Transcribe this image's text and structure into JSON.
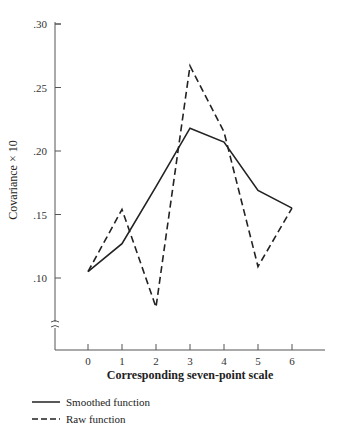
{
  "chart_data": {
    "type": "line",
    "title": "",
    "xlabel": "Corresponding seven-point scale",
    "ylabel": "Covariance × 10",
    "x": [
      0,
      1,
      2,
      3,
      4,
      5,
      6
    ],
    "categories": [
      "0",
      "1",
      "2",
      "3",
      "4",
      "5",
      "6"
    ],
    "yticks": [
      ".10",
      ".15",
      ".20",
      ".25",
      ".30"
    ],
    "ytick_values": [
      0.1,
      0.15,
      0.2,
      0.25,
      0.3
    ],
    "ylim": [
      0.06,
      0.3
    ],
    "axis_break": true,
    "grid": false,
    "legend_position": "bottom-left",
    "series": [
      {
        "name": "Smoothed function",
        "style": "solid",
        "values": [
          0.105,
          0.127,
          0.172,
          0.218,
          0.207,
          0.169,
          0.155
        ]
      },
      {
        "name": "Raw function",
        "style": "dashed",
        "values": [
          0.105,
          0.154,
          0.077,
          0.267,
          0.215,
          0.109,
          0.155
        ]
      }
    ]
  },
  "legend": {
    "smoothed_label": "Smoothed function",
    "raw_label": "Raw function"
  },
  "axes": {
    "xlabel": "Corresponding seven-point scale",
    "ylabel": "Covariance × 10"
  },
  "colors": {
    "line": "#222222",
    "axis": "#555555"
  }
}
